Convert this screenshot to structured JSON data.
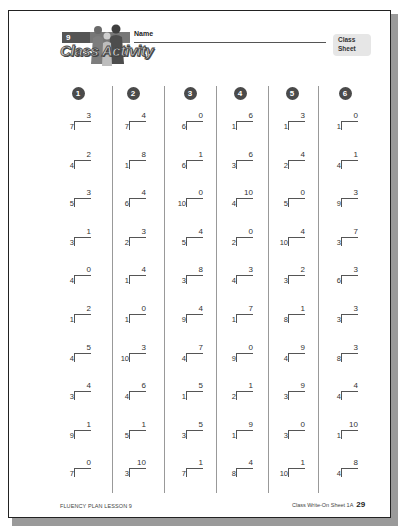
{
  "header": {
    "lesson_number": "9",
    "activity_title": "Class Activity",
    "name_label": "Name",
    "sheet_tag_line1": "Class",
    "sheet_tag_line2": "Sheet"
  },
  "columns": [
    {
      "number": "1",
      "problems": [
        {
          "divisor": "7",
          "quotient": "3"
        },
        {
          "divisor": "4",
          "quotient": "2"
        },
        {
          "divisor": "5",
          "quotient": "3"
        },
        {
          "divisor": "3",
          "quotient": "1"
        },
        {
          "divisor": "4",
          "quotient": "0"
        },
        {
          "divisor": "1",
          "quotient": "2"
        },
        {
          "divisor": "4",
          "quotient": "5"
        },
        {
          "divisor": "3",
          "quotient": "4"
        },
        {
          "divisor": "9",
          "quotient": "1"
        },
        {
          "divisor": "7",
          "quotient": "0"
        }
      ]
    },
    {
      "number": "2",
      "problems": [
        {
          "divisor": "7",
          "quotient": "4"
        },
        {
          "divisor": "1",
          "quotient": "8"
        },
        {
          "divisor": "6",
          "quotient": "4"
        },
        {
          "divisor": "2",
          "quotient": "3"
        },
        {
          "divisor": "1",
          "quotient": "4"
        },
        {
          "divisor": "1",
          "quotient": "0"
        },
        {
          "divisor": "10",
          "quotient": "3"
        },
        {
          "divisor": "4",
          "quotient": "6"
        },
        {
          "divisor": "5",
          "quotient": "1"
        },
        {
          "divisor": "3",
          "quotient": "10"
        }
      ]
    },
    {
      "number": "3",
      "problems": [
        {
          "divisor": "6",
          "quotient": "0"
        },
        {
          "divisor": "6",
          "quotient": "1"
        },
        {
          "divisor": "10",
          "quotient": "0"
        },
        {
          "divisor": "5",
          "quotient": "4"
        },
        {
          "divisor": "3",
          "quotient": "8"
        },
        {
          "divisor": "9",
          "quotient": "4"
        },
        {
          "divisor": "4",
          "quotient": "7"
        },
        {
          "divisor": "1",
          "quotient": "5"
        },
        {
          "divisor": "3",
          "quotient": "5"
        },
        {
          "divisor": "7",
          "quotient": "1"
        }
      ]
    },
    {
      "number": "4",
      "problems": [
        {
          "divisor": "1",
          "quotient": "6"
        },
        {
          "divisor": "3",
          "quotient": "6"
        },
        {
          "divisor": "4",
          "quotient": "10"
        },
        {
          "divisor": "2",
          "quotient": "0"
        },
        {
          "divisor": "4",
          "quotient": "3"
        },
        {
          "divisor": "1",
          "quotient": "7"
        },
        {
          "divisor": "9",
          "quotient": "0"
        },
        {
          "divisor": "2",
          "quotient": "1"
        },
        {
          "divisor": "1",
          "quotient": "9"
        },
        {
          "divisor": "8",
          "quotient": "4"
        }
      ]
    },
    {
      "number": "5",
      "problems": [
        {
          "divisor": "1",
          "quotient": "3"
        },
        {
          "divisor": "2",
          "quotient": "4"
        },
        {
          "divisor": "5",
          "quotient": "0"
        },
        {
          "divisor": "10",
          "quotient": "4"
        },
        {
          "divisor": "3",
          "quotient": "2"
        },
        {
          "divisor": "8",
          "quotient": "1"
        },
        {
          "divisor": "4",
          "quotient": "9"
        },
        {
          "divisor": "3",
          "quotient": "9"
        },
        {
          "divisor": "3",
          "quotient": "0"
        },
        {
          "divisor": "10",
          "quotient": "1"
        }
      ]
    },
    {
      "number": "6",
      "problems": [
        {
          "divisor": "1",
          "quotient": "0"
        },
        {
          "divisor": "4",
          "quotient": "1"
        },
        {
          "divisor": "9",
          "quotient": "3"
        },
        {
          "divisor": "3",
          "quotient": "7"
        },
        {
          "divisor": "6",
          "quotient": "3"
        },
        {
          "divisor": "3",
          "quotient": "3"
        },
        {
          "divisor": "8",
          "quotient": "3"
        },
        {
          "divisor": "4",
          "quotient": "4"
        },
        {
          "divisor": "1",
          "quotient": "10"
        },
        {
          "divisor": "4",
          "quotient": "8"
        }
      ]
    }
  ],
  "footer": {
    "left": "FLUENCY PLAN LESSON 9",
    "right": "Class Write-On Sheet 1A",
    "page_number": "29"
  },
  "colors": {
    "badge": "#4a4a4a",
    "divider": "#999999",
    "sheet_tag_bg": "#e6e6e6",
    "page_border": "#222222"
  }
}
